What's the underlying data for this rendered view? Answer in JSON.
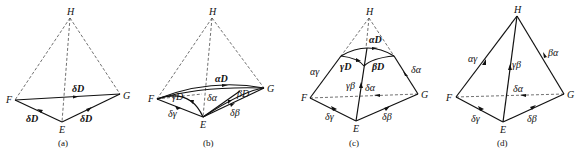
{
  "figure": {
    "panels": [
      {
        "id": "a",
        "caption": "(a)",
        "vertices": {
          "H": "H",
          "F": "F",
          "G": "G",
          "E": "E"
        },
        "edge_labels": {
          "FG": "δD",
          "EF": "δD",
          "EG": "δD"
        }
      },
      {
        "id": "b",
        "caption": "(b)",
        "vertices": {
          "H": "H",
          "F": "F",
          "G": "G",
          "E": "E"
        },
        "edge_labels": {
          "arc_FG": "αD",
          "gammaD": "γD",
          "deltaAlpha": "δα",
          "betaD": "βD",
          "EF": "δγ",
          "EG": "δβ"
        }
      },
      {
        "id": "c",
        "caption": "(c)",
        "vertices": {
          "H": "H",
          "F": "F",
          "G": "G",
          "E": "E"
        },
        "edge_labels": {
          "arc_top": "αD",
          "gammaD": "γD",
          "betaD": "βD",
          "left": "αγ",
          "right": "δα",
          "center": "γβ",
          "FG": "δα",
          "EF": "δγ",
          "EG": "δβ"
        }
      },
      {
        "id": "d",
        "caption": "(d)",
        "vertices": {
          "H": "H",
          "F": "F",
          "G": "G",
          "E": "E"
        },
        "edge_labels": {
          "FH": "αγ",
          "EH": "γβ",
          "GH": "βα",
          "FG": "δα",
          "EF": "δγ",
          "EG": "δβ"
        }
      }
    ]
  }
}
